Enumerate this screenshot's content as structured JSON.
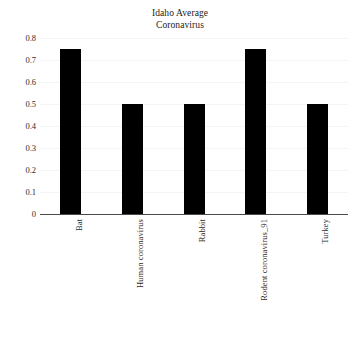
{
  "chart_data": {
    "type": "bar",
    "title": "Idaho Average Coronavirus",
    "title_lines": [
      "Idaho Average",
      "Coronavirus"
    ],
    "categories": [
      "Bat",
      "Human coronavirus",
      "Rabbit",
      "Rodent coronavirus_91",
      "Turkey"
    ],
    "values": [
      0.75,
      0.5,
      0.5,
      0.75,
      0.5
    ],
    "xlabel": "",
    "ylabel": "",
    "ylim": [
      0,
      0.8
    ],
    "ytick_labels": [
      "0.8",
      "0.7",
      "0.6",
      "0.5",
      "0.4",
      "0.3",
      "0.2",
      "0.1",
      "0"
    ],
    "ytick_values": [
      0.8,
      0.7,
      0.6,
      0.5,
      0.4,
      0.3,
      0.2,
      0.1,
      0
    ],
    "grid": true,
    "legend": null,
    "bar_color": "#000000",
    "background_color": "#ffffff",
    "axis_color": "#4a4a4a",
    "gridline_color": "#f4f4f5",
    "xtick_rotation_degrees": 90
  }
}
